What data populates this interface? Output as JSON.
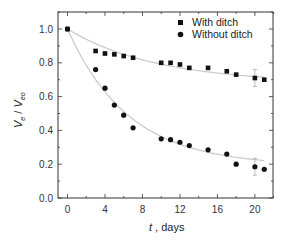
{
  "chart_data": {
    "type": "scatter",
    "title": "",
    "xlabel": "t , days",
    "xlabel_italic_part": "t",
    "xlabel_rest": " , days",
    "ylabel": "Ve / Veo",
    "ylabel_parts": {
      "V1": "V",
      "sub1": "e",
      "slash": " / ",
      "V2": "V",
      "sub2": "eo"
    },
    "xlim": [
      -1.1,
      22
    ],
    "ylim": [
      0.0,
      1.1
    ],
    "xticks": [
      0,
      4,
      8,
      12,
      16,
      20
    ],
    "yticks": [
      0.0,
      0.2,
      0.4,
      0.6,
      0.8,
      1.0
    ],
    "ytick_labels": [
      "0.0",
      "0.2",
      "0.4",
      "0.6",
      "0.8",
      "1.0"
    ],
    "grid": false,
    "legend_position": "upper right",
    "series": [
      {
        "name": "With ditch",
        "marker": "square",
        "x": [
          0,
          3,
          4,
          5,
          6,
          7,
          10,
          11,
          12,
          13,
          15,
          17,
          18,
          20,
          21
        ],
        "y": [
          1.0,
          0.87,
          0.855,
          0.85,
          0.84,
          0.83,
          0.8,
          0.8,
          0.79,
          0.77,
          0.77,
          0.75,
          0.73,
          0.71,
          0.7
        ],
        "error_bars": [
          {
            "x": 20,
            "y": 0.71,
            "err": 0.05
          }
        ],
        "fit_curve": {
          "type": "exponential_decay",
          "y0": 0.68,
          "A": 0.32,
          "tau": 9.5
        }
      },
      {
        "name": "Without ditch",
        "marker": "circle",
        "x": [
          0,
          3,
          4,
          5,
          6,
          7,
          10,
          11,
          12,
          13,
          15,
          17,
          18,
          20,
          21
        ],
        "y": [
          1.0,
          0.76,
          0.65,
          0.55,
          0.49,
          0.415,
          0.35,
          0.345,
          0.33,
          0.31,
          0.285,
          0.26,
          0.2,
          0.185,
          0.17
        ],
        "error_bars": [
          {
            "x": 20,
            "y": 0.185,
            "err": 0.05
          }
        ],
        "fit_curve": {
          "type": "exponential_decay",
          "y0": 0.19,
          "A": 0.81,
          "tau": 6.5
        }
      }
    ]
  },
  "colors": {
    "marker": "#111111",
    "fit_line": "#c8c8c8",
    "error_bar": "#aaaaaa",
    "axis": "#333333"
  }
}
